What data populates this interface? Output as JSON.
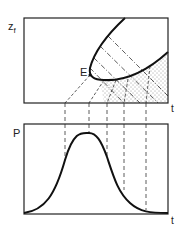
{
  "top_panel": {
    "y_axis_label": "z",
    "y_axis_subscript": "f",
    "x_axis_label": "t",
    "point_label": "E"
  },
  "bottom_panel": {
    "y_axis_label": "P",
    "x_axis_label": "t"
  },
  "colors": {
    "line": "#222222",
    "background": "#ffffff"
  }
}
